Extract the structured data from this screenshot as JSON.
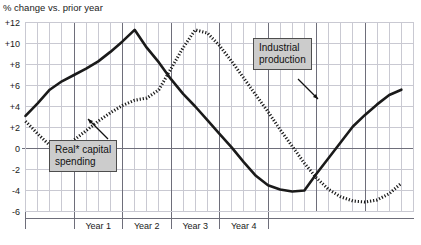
{
  "chart_data": {
    "type": "line",
    "title": "% change vs. prior year",
    "xlabel": "",
    "ylabel": "% change vs. prior year",
    "grid": true,
    "legend_position": "inline-callouts",
    "ylim": [
      -6,
      12
    ],
    "yticks": [
      12,
      10,
      8,
      6,
      4,
      2,
      0,
      -2,
      -4,
      -6
    ],
    "ytick_labels": [
      "+12",
      "+10",
      "+8",
      "+6",
      "+4",
      "+2",
      "0",
      "-2",
      "-4",
      "-6"
    ],
    "x_band_labels": [
      "Year 1",
      "Year 2",
      "Year 3",
      "Year 4"
    ],
    "x_note": "Quarterly observations; vertical heavy rules mark year boundaries",
    "x": [
      0,
      1,
      2,
      3,
      4,
      5,
      6,
      7,
      8,
      9,
      10,
      11,
      12,
      13,
      14,
      15,
      16,
      17,
      18,
      19,
      20,
      21,
      22,
      23,
      24,
      25,
      26,
      27,
      28,
      29,
      30,
      31
    ],
    "series": [
      {
        "name": "Industrial production",
        "style": "solid",
        "color": "#1a1a1a",
        "values": [
          3.1,
          4.3,
          5.6,
          6.4,
          7.0,
          7.6,
          8.3,
          9.2,
          10.2,
          11.3,
          9.6,
          8.2,
          6.6,
          5.2,
          4.0,
          2.7,
          1.4,
          0.1,
          -1.3,
          -2.6,
          -3.5,
          -3.9,
          -4.1,
          -4.0,
          -2.4,
          -0.9,
          0.6,
          2.1,
          3.2,
          4.2,
          5.1,
          5.6
        ]
      },
      {
        "name": "Real* capital spending",
        "style": "dotted",
        "color": "#1a1a1a",
        "values": [
          2.6,
          1.4,
          0.3,
          0.0,
          0.8,
          1.7,
          2.6,
          3.4,
          4.1,
          4.6,
          4.8,
          5.6,
          7.6,
          9.6,
          11.3,
          11.0,
          9.8,
          8.3,
          6.7,
          5.1,
          3.5,
          1.8,
          0.2,
          -1.4,
          -2.8,
          -3.9,
          -4.6,
          -5.0,
          -5.1,
          -4.9,
          -4.3,
          -3.3
        ]
      }
    ],
    "annotations": [
      {
        "name": "Real* capital spending",
        "target_series": "Real* capital spending"
      },
      {
        "name": "Industrial production",
        "target_series": "Industrial production"
      }
    ]
  },
  "header": {
    "title": "% change vs. prior year"
  },
  "axes": {
    "y_labels": [
      "+12",
      "+10",
      "+8",
      "+6",
      "+4",
      "+2",
      "0",
      "-2",
      "-4",
      "-6"
    ],
    "x_labels": [
      "Year 1",
      "Year 2",
      "Year 3",
      "Year 4"
    ]
  },
  "callouts": {
    "real_capital": "Real* capital\nspending",
    "industrial": "Industrial\nproduction"
  },
  "colors": {
    "ink": "#1a1a1a",
    "grid_minor": "#c9c9d2",
    "grid_major": "#6e6e7a",
    "callout_fill": "#cccccc",
    "callout_border": "#4d4d4d"
  }
}
